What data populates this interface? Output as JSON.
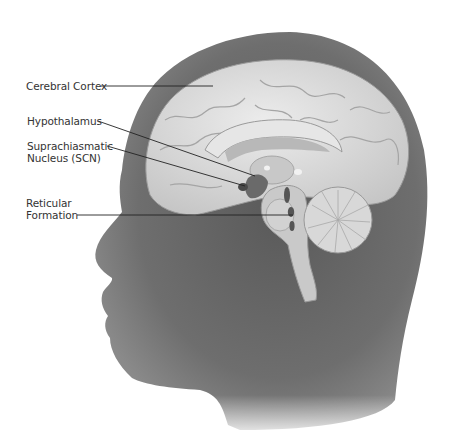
{
  "figure": {
    "labels": [
      {
        "id": "cerebral-cortex",
        "text": "Cerebral Cortex",
        "x": 26,
        "y": 80
      },
      {
        "id": "hypothalamus",
        "text": "Hypothalamus",
        "x": 27,
        "y": 115
      },
      {
        "id": "scn",
        "text": "Suprachiasmatic\nNucleus (SCN)",
        "x": 27,
        "y": 140
      },
      {
        "id": "reticular-formation",
        "text": "Reticular\nFormation",
        "x": 26,
        "y": 197
      }
    ],
    "leaders": [
      {
        "id": "cerebral-cortex",
        "x1": 101,
        "y1": 86,
        "x2": 213,
        "y2": 86
      },
      {
        "id": "hypothalamus",
        "x1": 98,
        "y1": 121,
        "x2": 255,
        "y2": 176
      },
      {
        "id": "scn",
        "x1": 107,
        "y1": 146,
        "x2": 245,
        "y2": 186
      },
      {
        "id": "reticular-formation",
        "x1": 77,
        "y1": 215,
        "x2": 293,
        "y2": 215
      }
    ],
    "colors": {
      "skin": "#6b6b6b",
      "skin_dark": "#4a4a4a",
      "brain": "#dcdcdc",
      "brain_shadow": "#a9a9a9",
      "nucleus": "#555555",
      "leader": "#222222",
      "text": "#333333"
    }
  }
}
